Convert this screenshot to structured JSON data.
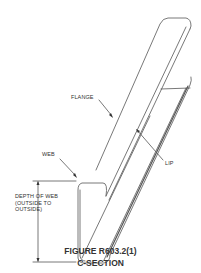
{
  "figure": {
    "title": "FIGURE R603.2(1)",
    "subtitle": "C-SECTION"
  },
  "labels": {
    "flange": "FLANGE",
    "web": "WEB",
    "lip": "LIP",
    "depth_line1": "DEPTH OF WEB",
    "depth_line2": "(OUTSIDE TO",
    "depth_line3": "OUTSIDE)"
  },
  "colors": {
    "line": "#555555",
    "text": "#333333",
    "background": "#ffffff"
  }
}
